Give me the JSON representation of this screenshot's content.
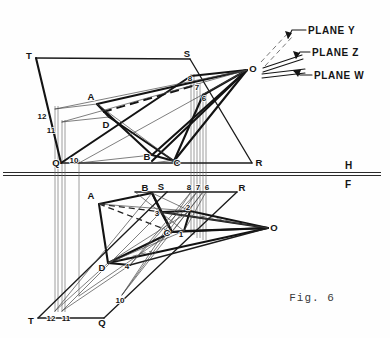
{
  "figure": {
    "caption": "Fig. 6",
    "reference_line": {
      "upper_label": "H",
      "lower_label": "F"
    }
  },
  "plane_callouts": [
    {
      "name": "PLANE Y",
      "text_x": 308,
      "text_y": 33
    },
    {
      "name": "PLANE Z",
      "text_x": 312,
      "text_y": 56
    },
    {
      "name": "PLANE W",
      "text_x": 314,
      "text_y": 78
    }
  ],
  "top_view": {
    "title": "horizontal-projection",
    "vertices": {
      "T": {
        "label": "T",
        "x": 36,
        "y": 58,
        "lx": 29,
        "ly": 59
      },
      "S": {
        "label": "S",
        "x": 190,
        "y": 59,
        "lx": 187,
        "ly": 57
      },
      "Q": {
        "label": "Q",
        "x": 61,
        "y": 163,
        "lx": 56,
        "ly": 164
      },
      "R": {
        "label": "R",
        "x": 252,
        "y": 163,
        "lx": 257,
        "ly": 164
      },
      "O": {
        "label": "O",
        "x": 247,
        "y": 70,
        "lx": 252,
        "ly": 70
      },
      "A": {
        "label": "A",
        "x": 97,
        "y": 104,
        "lx": 91,
        "ly": 99
      },
      "B": {
        "label": "B",
        "x": 152,
        "y": 155,
        "lx": 147,
        "ly": 157
      },
      "C": {
        "label": "C",
        "x": 174,
        "y": 161,
        "lx": 176,
        "ly": 163
      },
      "D": {
        "label": "D",
        "x": 109,
        "y": 117,
        "lx": 104,
        "ly": 126
      }
    },
    "numbered_points": [
      {
        "label": "12",
        "x": 55,
        "y": 109,
        "lx": 44,
        "ly": 116
      },
      {
        "label": "11",
        "x": 62,
        "y": 122,
        "lx": 52,
        "ly": 130
      },
      {
        "label": "10",
        "x": 79,
        "y": 163,
        "lx": 74,
        "ly": 161
      },
      {
        "label": "8",
        "x": 191,
        "y": 76,
        "lx": 192,
        "ly": 79
      },
      {
        "label": "7",
        "x": 197,
        "y": 85,
        "lx": 198,
        "ly": 88
      },
      {
        "label": "6",
        "x": 203,
        "y": 95,
        "lx": 203,
        "ly": 99
      }
    ]
  },
  "front_view": {
    "title": "frontal-projection",
    "vertices": {
      "T": {
        "label": "T",
        "x": 38,
        "y": 318,
        "lx": 31,
        "ly": 321
      },
      "S": {
        "label": "S",
        "x": 167,
        "y": 192,
        "lx": 161,
        "ly": 190
      },
      "Q": {
        "label": "Q",
        "x": 104,
        "y": 318,
        "lx": 101,
        "ly": 323
      },
      "R": {
        "label": "R",
        "x": 237,
        "y": 192,
        "lx": 241,
        "ly": 191
      },
      "O": {
        "label": "O",
        "x": 268,
        "y": 228,
        "lx": 273,
        "ly": 229
      },
      "A": {
        "label": "A",
        "x": 99,
        "y": 204,
        "lx": 92,
        "ly": 199
      },
      "B": {
        "label": "B",
        "x": 152,
        "y": 193,
        "lx": 146,
        "ly": 191
      },
      "C": {
        "label": "C",
        "x": 172,
        "y": 232,
        "lx": 166,
        "ly": 233
      },
      "D": {
        "label": "D",
        "x": 108,
        "y": 263,
        "lx": 102,
        "ly": 269
      }
    },
    "numbered_points": [
      {
        "label": "12",
        "x": 55,
        "y": 311,
        "lx": 50,
        "ly": 318
      },
      {
        "label": "11",
        "x": 62,
        "y": 311,
        "lx": 64,
        "ly": 318
      },
      {
        "label": "10",
        "x": 122,
        "y": 295,
        "lx": 118,
        "ly": 301
      },
      {
        "label": "8",
        "x": 191,
        "y": 192,
        "lx": 188,
        "ly": 190
      },
      {
        "label": "7",
        "x": 197,
        "y": 192,
        "lx": 198,
        "ly": 190
      },
      {
        "label": "6",
        "x": 203,
        "y": 192,
        "lx": 206,
        "ly": 190
      },
      {
        "label": "3",
        "x": 161,
        "y": 212,
        "lx": 157,
        "ly": 215
      },
      {
        "label": "2",
        "x": 190,
        "y": 211,
        "lx": 187,
        "ly": 210
      },
      {
        "label": "1",
        "x": 184,
        "y": 231,
        "lx": 181,
        "ly": 235
      },
      {
        "label": "4",
        "x": 130,
        "y": 265,
        "lx": 127,
        "ly": 266
      }
    ]
  }
}
